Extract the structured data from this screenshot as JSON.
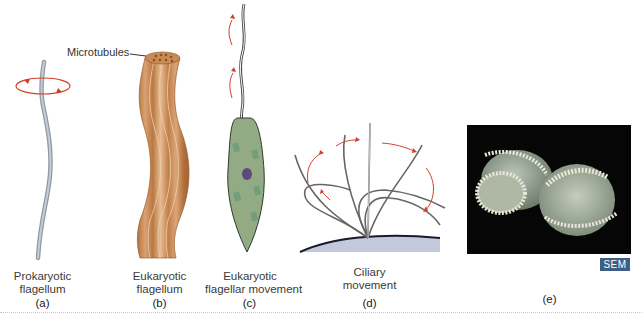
{
  "figure": {
    "panels": [
      {
        "id": "a",
        "letter": "(a)",
        "caption_line1": "Prokaryotic",
        "caption_line2": "flagellum"
      },
      {
        "id": "b",
        "letter": "(b)",
        "caption_line1": "Eukaryotic",
        "caption_line2": "flagellum",
        "callout": "Microtubules"
      },
      {
        "id": "c",
        "letter": "(c)",
        "caption_line1": "Eukaryotic",
        "caption_line2": "flagellar movement"
      },
      {
        "id": "d",
        "letter": "(d)",
        "caption_line1": "Ciliary",
        "caption_line2": "movement"
      },
      {
        "id": "e",
        "letter": "(e)",
        "badge": "SEM"
      }
    ],
    "colors": {
      "arrow": "#d2402b",
      "prokaryotic_flagellum": "#a9b3bd",
      "eukaryotic_flagellum": "#c8874f",
      "cell_body": "#93ab84",
      "nucleus": "#5d4a78",
      "sem_badge": "#3d5f86",
      "cilia_surface": "#c3c8da"
    }
  }
}
